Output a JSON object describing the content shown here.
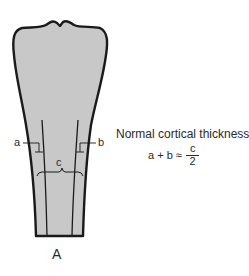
{
  "figure": {
    "panel_label": "A",
    "labels": {
      "a": "a",
      "b": "b",
      "c": "c"
    },
    "caption": "Normal cortical thickness =",
    "formula": {
      "lhs": "a + b ≈",
      "numerator": "c",
      "denominator": "2"
    },
    "colors": {
      "bone_fill": "#c8c8c8",
      "outline": "#1a1a1a",
      "text": "#2a2a2a"
    }
  }
}
